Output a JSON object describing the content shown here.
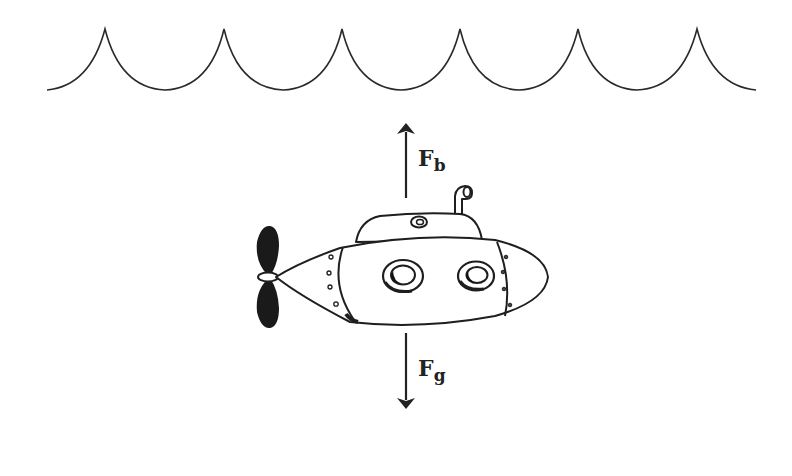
{
  "diagram": {
    "title": "",
    "elements": [
      "water-surface-waves",
      "submarine",
      "buoyant-force-arrow",
      "gravity-force-arrow"
    ]
  },
  "forces": {
    "buoyant": {
      "main": "F",
      "sub": "b",
      "direction": "up"
    },
    "gravity": {
      "main": "F",
      "sub": "g",
      "direction": "down"
    }
  },
  "colors": {
    "line": "#2a2a2a",
    "fill": "#ffffff",
    "propeller": "#1a1a1a"
  }
}
